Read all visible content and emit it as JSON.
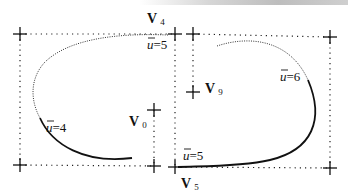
{
  "diagram": {
    "title": "",
    "vertices": [
      {
        "name": "V",
        "sub": "4",
        "label_x": 147,
        "label_y": 22
      },
      {
        "name": "V",
        "sub": "0",
        "label_x": 129,
        "label_y": 125
      },
      {
        "name": "V",
        "sub": "9",
        "label_x": 205,
        "label_y": 93
      },
      {
        "name": "V",
        "sub": "5",
        "label_x": 181,
        "label_y": 188
      }
    ],
    "parameter_labels": [
      {
        "text_var": "u",
        "text_eq": "=5",
        "x": 147,
        "y": 49
      },
      {
        "text_var": "u",
        "text_eq": "=4",
        "x": 46,
        "y": 132
      },
      {
        "text_var": "u",
        "text_eq": "=6",
        "x": 280,
        "y": 81
      },
      {
        "text_var": "u",
        "text_eq": "=5",
        "x": 183,
        "y": 160
      }
    ],
    "colors": {
      "stroke": "#111111",
      "background": "#ffffff"
    }
  }
}
